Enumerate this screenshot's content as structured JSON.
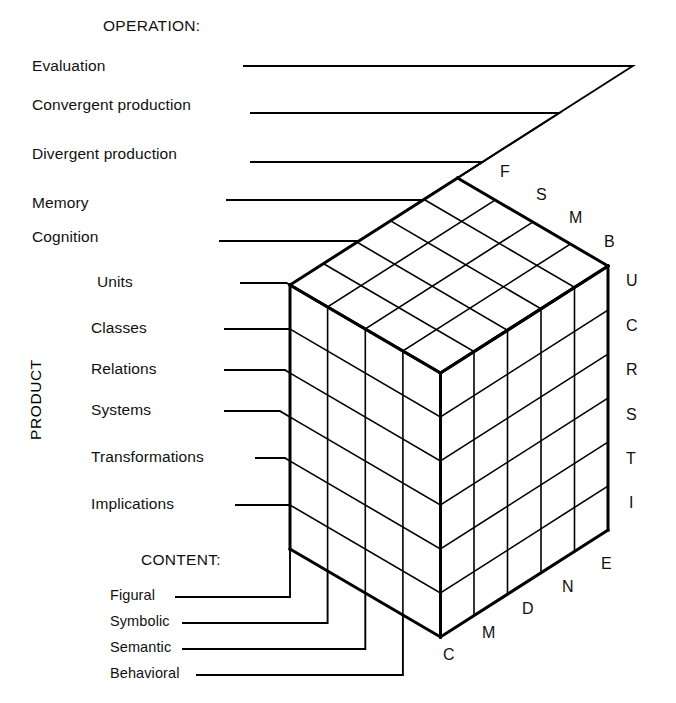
{
  "figure": {
    "name": "Guilford Structure of Intellect cube",
    "line_color": "#000000",
    "face_color": "#ffffff"
  },
  "axes": {
    "operation": {
      "heading": "OPERATION:",
      "labels": [
        "Evaluation",
        "Convergent production",
        "Divergent production",
        "Memory",
        "Cognition"
      ],
      "initials": [
        "E",
        "N",
        "D",
        "M",
        "C"
      ]
    },
    "product": {
      "heading": "PRODUCT",
      "labels": [
        "Units",
        "Classes",
        "Relations",
        "Systems",
        "Transformations",
        "Implications"
      ],
      "initials": [
        "U",
        "C",
        "R",
        "S",
        "T",
        "I"
      ]
    },
    "content": {
      "heading": "CONTENT:",
      "labels": [
        "Figural",
        "Symbolic",
        "Semantic",
        "Behavioral"
      ],
      "initials": [
        "F",
        "S",
        "M",
        "B"
      ]
    }
  },
  "cube": {
    "content_divisions": 4,
    "operation_divisions": 5,
    "product_divisions": 6
  }
}
